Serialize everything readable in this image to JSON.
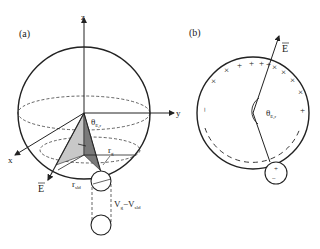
{
  "panels": [
    {
      "id": "a",
      "label": "(a)",
      "axes": {
        "z": "z",
        "y": "y",
        "x": "x"
      },
      "angle_label": "θ",
      "angle_sub": "E,r",
      "field_label": "E",
      "radius_g_label": "r",
      "radius_g_sub": "g",
      "radius_sld_label": "r",
      "radius_sld_sub": "sld",
      "volume_label": "V",
      "volume_g_sub": "g",
      "volume_sep": "−V",
      "volume_sld_sub": "sld"
    },
    {
      "id": "b",
      "label": "(b)",
      "field_label": "E",
      "angle_label": "θ",
      "angle_sub": "E,r",
      "charge_plus": "+",
      "charge_minus": "−",
      "charge_cross": "×",
      "droplet_charges": [
        "+",
        "−"
      ]
    }
  ],
  "colors": {
    "stroke": "#222222",
    "shade_light": "#c8c8c8",
    "shade_dark": "#7a7a7a",
    "background": "#ffffff"
  }
}
